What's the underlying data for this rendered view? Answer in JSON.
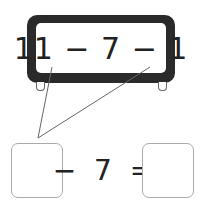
{
  "expression": {
    "text": "11 − 7 − 1",
    "terms": [
      "11",
      "7",
      "1"
    ],
    "operator": "−"
  },
  "equation": {
    "left_blank": "",
    "middle": "−  7  =",
    "subtrahend": "7",
    "right_blank": ""
  },
  "colors": {
    "frame": "#2a2a2a",
    "box_border": "#aaaaaa",
    "line": "#666666"
  }
}
